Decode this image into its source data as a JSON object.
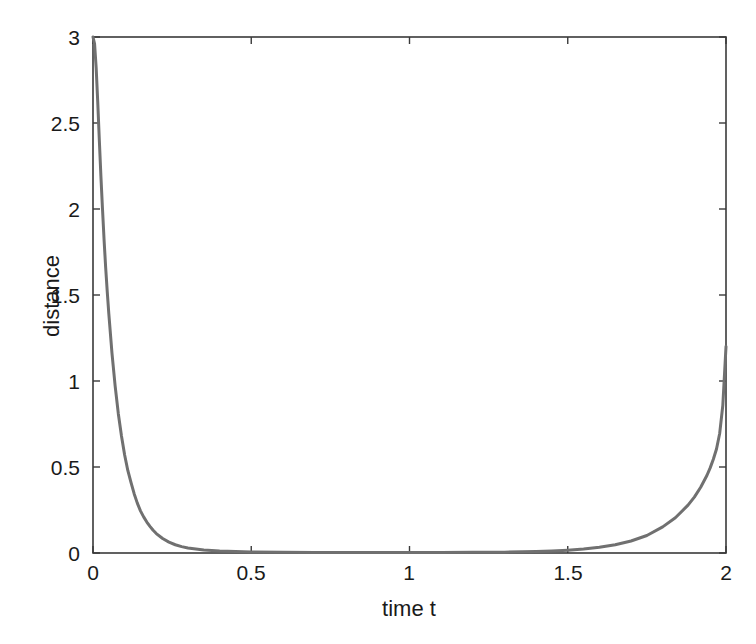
{
  "figure": {
    "background_color": "#ffffff",
    "axis_color": "#3a3a3a",
    "text_color": "#1a1a1a",
    "line_color": "#707070"
  },
  "axes": {
    "x_title": "time t",
    "y_title": "distance",
    "x_ticks": [
      "0",
      "0.5",
      "1",
      "1.5",
      "2"
    ],
    "y_ticks": [
      "0",
      "0.5",
      "1",
      "1.5",
      "2",
      "2.5",
      "3"
    ]
  },
  "chart_data": {
    "type": "line",
    "title": "",
    "subtitle": "",
    "xlabel": "time t",
    "ylabel": "distance",
    "xlim": [
      0,
      2
    ],
    "ylim": [
      0,
      3
    ],
    "xticks": [
      0,
      0.5,
      1,
      1.5,
      2
    ],
    "yticks": [
      0,
      0.5,
      1,
      1.5,
      2,
      2.5,
      3
    ],
    "grid": false,
    "legend": null,
    "legend_position": "none",
    "annotations": [],
    "series": [
      {
        "name": "distance",
        "color": "#707070",
        "line_width": 3,
        "x": [
          0.0,
          0.005,
          0.01,
          0.015,
          0.02,
          0.025,
          0.03,
          0.035,
          0.04,
          0.045,
          0.05,
          0.06,
          0.07,
          0.08,
          0.09,
          0.1,
          0.11,
          0.12,
          0.13,
          0.14,
          0.15,
          0.16,
          0.17,
          0.18,
          0.19,
          0.2,
          0.22,
          0.24,
          0.26,
          0.28,
          0.3,
          0.35,
          0.4,
          0.5,
          0.6,
          0.7,
          0.8,
          0.9,
          1.0,
          1.1,
          1.2,
          1.3,
          1.4,
          1.45,
          1.5,
          1.55,
          1.6,
          1.65,
          1.7,
          1.75,
          1.8,
          1.84,
          1.88,
          1.9,
          1.92,
          1.94,
          1.95,
          1.96,
          1.97,
          1.98,
          1.99,
          2.0
        ],
        "y": [
          3.0,
          2.96,
          2.82,
          2.62,
          2.4,
          2.19,
          2.0,
          1.82,
          1.66,
          1.52,
          1.39,
          1.16,
          0.97,
          0.81,
          0.68,
          0.57,
          0.48,
          0.41,
          0.345,
          0.29,
          0.245,
          0.21,
          0.18,
          0.155,
          0.132,
          0.113,
          0.084,
          0.063,
          0.048,
          0.037,
          0.029,
          0.017,
          0.011,
          0.006,
          0.004,
          0.003,
          0.003,
          0.003,
          0.003,
          0.003,
          0.004,
          0.005,
          0.008,
          0.011,
          0.016,
          0.023,
          0.033,
          0.048,
          0.07,
          0.102,
          0.152,
          0.205,
          0.278,
          0.325,
          0.382,
          0.452,
          0.495,
          0.545,
          0.605,
          0.695,
          0.86,
          1.2
        ]
      }
    ]
  },
  "geometry": {
    "plot_left": 93,
    "plot_right": 726,
    "plot_top": 37,
    "plot_bottom": 553
  }
}
